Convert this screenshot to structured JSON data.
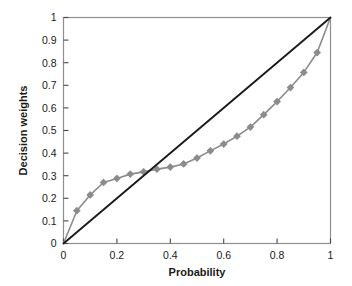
{
  "chart_data": {
    "type": "line",
    "title": "",
    "xlabel": "Probability",
    "ylabel": "Decision weights",
    "xlim": [
      0,
      1
    ],
    "ylim": [
      0,
      1
    ],
    "grid": false,
    "legend": "none",
    "xticks": [
      "0",
      "0.2",
      "0.4",
      "0.6",
      "0.8",
      "1"
    ],
    "xtick_values": [
      0,
      0.2,
      0.4,
      0.6,
      0.8,
      1
    ],
    "yticks": [
      "0",
      "0.1",
      "0.2",
      "0.3",
      "0.4",
      "0.5",
      "0.6",
      "0.7",
      "0.8",
      "0.9",
      "1"
    ],
    "ytick_values": [
      0,
      0.1,
      0.2,
      0.3,
      0.4,
      0.5,
      0.6,
      0.7,
      0.8,
      0.9,
      1
    ],
    "series": [
      {
        "name": "Decision weight function",
        "color": "#8c8c8c",
        "marker": "diamond",
        "x": [
          0,
          0.05,
          0.1,
          0.15,
          0.2,
          0.25,
          0.3,
          0.35,
          0.4,
          0.45,
          0.5,
          0.55,
          0.6,
          0.65,
          0.7,
          0.75,
          0.8,
          0.85,
          0.9,
          0.95,
          1
        ],
        "values": [
          0,
          0.145,
          0.215,
          0.27,
          0.288,
          0.307,
          0.317,
          0.329,
          0.338,
          0.352,
          0.378,
          0.41,
          0.44,
          0.475,
          0.515,
          0.57,
          0.628,
          0.69,
          0.757,
          0.845,
          1
        ]
      },
      {
        "name": "Identity line",
        "color": "#1a1a1a",
        "marker": "none",
        "x": [
          0,
          1
        ],
        "values": [
          0,
          1
        ]
      }
    ],
    "annotations": []
  },
  "axes": {
    "x_label": "Probability",
    "y_label": "Decision weights"
  }
}
